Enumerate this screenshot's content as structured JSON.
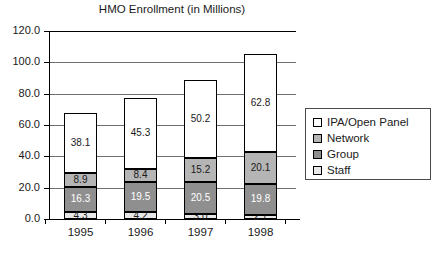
{
  "chart_data": {
    "type": "bar",
    "subtype": "stacked-column",
    "title": "HMO Enrollment (in Millions)",
    "xlabel": "",
    "ylabel": "",
    "categories": [
      "1995",
      "1996",
      "1997",
      "1998"
    ],
    "ylim": [
      0,
      120
    ],
    "ytick_labels": [
      "0.0",
      "20.0",
      "40.0",
      "60.0",
      "80.0",
      "100.0",
      "120.0"
    ],
    "ytick_values": [
      0,
      20,
      40,
      60,
      80,
      100,
      120
    ],
    "grid": true,
    "legend_position": "right",
    "series": [
      {
        "name": "Staff",
        "color": "#e8e8e8",
        "label_color": "#1a1a1a",
        "values": [
          4.3,
          4.2,
          3.0,
          2.7
        ],
        "labels": [
          "4.3",
          "4.2",
          "3.0",
          "2.7"
        ]
      },
      {
        "name": "Group",
        "color": "#8f8f8f",
        "label_color": "#ffffff",
        "values": [
          16.3,
          19.5,
          20.5,
          19.8
        ],
        "labels": [
          "16.3",
          "19.5",
          "20.5",
          "19.8"
        ]
      },
      {
        "name": "Network",
        "color": "#b5b5b5",
        "label_color": "#1a1a1a",
        "values": [
          8.9,
          8.4,
          15.2,
          20.1
        ],
        "labels": [
          "8.9",
          "8.4",
          "15.2",
          "20.1"
        ]
      },
      {
        "name": "IPA/Open Panel",
        "color": "#ffffff",
        "label_color": "#1a1a1a",
        "values": [
          38.1,
          45.3,
          50.2,
          62.8
        ],
        "labels": [
          "38.1",
          "45.3",
          "50.2",
          "62.8"
        ]
      }
    ],
    "totals": [
      67.6,
      77.4,
      88.9,
      105.4
    ]
  },
  "legend": {
    "entries": [
      {
        "label": "IPA/Open Panel",
        "color": "#ffffff"
      },
      {
        "label": "Network",
        "color": "#b5b5b5"
      },
      {
        "label": "Group",
        "color": "#8f8f8f"
      },
      {
        "label": "Staff",
        "color": "#e8e8e8"
      }
    ]
  }
}
